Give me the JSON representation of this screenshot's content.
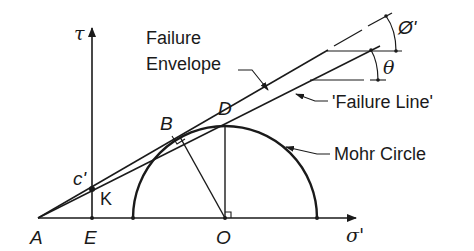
{
  "diagram": {
    "type": "Mohr-Coulomb failure diagram",
    "axes": {
      "vertical": "τ",
      "horizontal": "σ'"
    },
    "points": {
      "A": "A",
      "E": "E",
      "O": "O",
      "B": "B",
      "D": "D",
      "K": "K",
      "c": "c'"
    },
    "labels": {
      "failure_envelope_line1": "Failure",
      "failure_envelope_line2": "Envelope",
      "failure_line": "'Failure Line'",
      "mohr_circle": "Mohr Circle"
    },
    "angles": {
      "phi": "Ø'",
      "theta": "θ"
    },
    "colors": {
      "ink": "#1a1a1a",
      "background": "#ffffff"
    }
  }
}
